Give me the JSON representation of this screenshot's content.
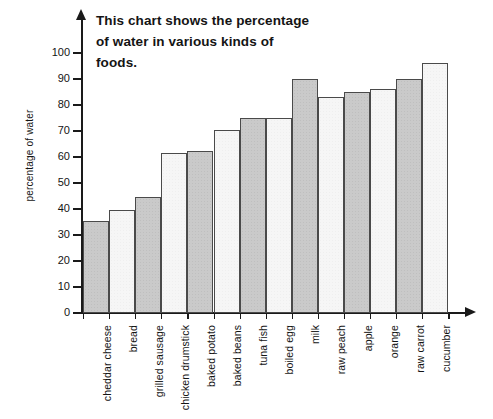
{
  "chart_data": {
    "type": "bar",
    "title": "This chart shows the percentage of water in various kinds of foods.",
    "title_lines": [
      "This chart shows the percentage",
      "of water in various kinds of",
      "foods."
    ],
    "xlabel": "",
    "ylabel": "percentage of water",
    "ylim": [
      0,
      105
    ],
    "ytick_values": [
      0,
      10,
      20,
      30,
      40,
      50,
      60,
      70,
      80,
      90,
      100
    ],
    "ytick_labels": [
      "0",
      "10",
      "20",
      "30",
      "40",
      "50",
      "60",
      "70",
      "80",
      "90",
      "100"
    ],
    "grid": false,
    "legend": "none",
    "categories": [
      "cheddar cheese",
      "bread",
      "grilled sausage",
      "chicken drumstick",
      "baked potato",
      "baked beans",
      "tuna fish",
      "boiled egg",
      "milk",
      "raw peach",
      "apple",
      "orange",
      "raw carrot",
      "cucumber"
    ],
    "values": [
      35.5,
      39.5,
      44.5,
      61.5,
      62.5,
      70.5,
      75,
      75,
      90,
      83,
      85,
      86,
      90,
      96
    ],
    "bar_colors": {
      "odd": "#cacaca",
      "even": "#f6f6f6",
      "border": "#4a4a4a"
    },
    "axis_color": "#1a1a1a"
  }
}
